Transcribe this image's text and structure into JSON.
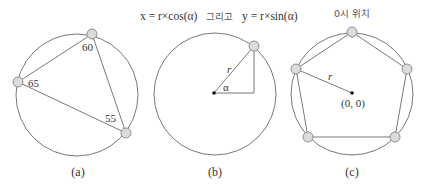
{
  "figure": {
    "panel_a": {
      "caption": "(a)",
      "angles": [
        "60",
        "65",
        "55"
      ]
    },
    "panel_b": {
      "caption": "(b)",
      "formula_x": "x = r×cos(α)",
      "formula_join": "그리고",
      "formula_y": "y = r×sin(α)",
      "radius_label": "r",
      "angle_label": "α"
    },
    "panel_c": {
      "caption": "(c)",
      "title": "0시 위치",
      "radius_label": "r",
      "origin_label": "(0, 0)",
      "node_count": 5
    }
  }
}
